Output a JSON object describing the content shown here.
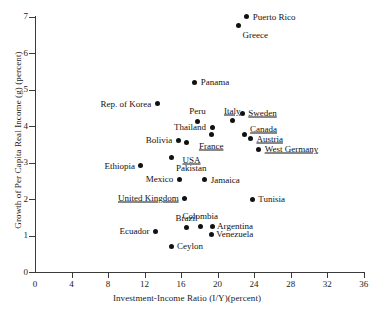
{
  "chart_data": {
    "type": "scatter",
    "title": "",
    "xlabel": "Investment-Income Ratio (I/Y)(percent)",
    "ylabel": "Growth of Per Capita Real Income (g) (percent)",
    "xlim": [
      0,
      36
    ],
    "ylim": [
      0,
      7
    ],
    "xticks": [
      "0",
      "4",
      "8",
      "12",
      "16",
      "20",
      "24",
      "28",
      "32",
      "36"
    ],
    "yticks": [
      "0",
      "1",
      "2",
      "3",
      "4",
      "5",
      "6",
      "7"
    ],
    "grid": false,
    "legend": null,
    "points": [
      {
        "label": "Puerto Rico",
        "x": 23.2,
        "y": 7.0,
        "underlined": false,
        "pos": "l",
        "dx": 6,
        "dy": 0
      },
      {
        "label": "Greece",
        "x": 22.3,
        "y": 6.75,
        "underlined": false,
        "pos": "l",
        "dx": 4,
        "dy": 9
      },
      {
        "label": "Panama",
        "x": 17.5,
        "y": 5.2,
        "underlined": false,
        "pos": "l",
        "dx": 6,
        "dy": 0
      },
      {
        "label": "Rep. of Korea",
        "x": 13.4,
        "y": 4.62,
        "underlined": false,
        "pos": "r",
        "dx": -6,
        "dy": 0
      },
      {
        "label": "Sweden",
        "x": 22.7,
        "y": 4.36,
        "underlined": true,
        "pos": "l",
        "dx": 6,
        "dy": 0
      },
      {
        "label": "Italy",
        "x": 21.6,
        "y": 4.15,
        "underlined": true,
        "pos": "c",
        "dx": 0,
        "dy": -10
      },
      {
        "label": "Peru",
        "x": 17.8,
        "y": 4.14,
        "underlined": false,
        "pos": "c",
        "dx": 0,
        "dy": -10
      },
      {
        "label": "Thailand",
        "x": 19.4,
        "y": 3.97,
        "underlined": false,
        "pos": "r",
        "dx": -6,
        "dy": 0
      },
      {
        "label": "Canada",
        "x": 22.9,
        "y": 3.77,
        "underlined": true,
        "pos": "l",
        "dx": 6,
        "dy": -6
      },
      {
        "label": "France",
        "x": 19.3,
        "y": 3.78,
        "underlined": true,
        "pos": "c",
        "dx": 0,
        "dy": 12
      },
      {
        "label": "Austria",
        "x": 23.6,
        "y": 3.66,
        "underlined": true,
        "pos": "l",
        "dx": 6,
        "dy": 0
      },
      {
        "label": "Bolivia",
        "x": 15.7,
        "y": 3.62,
        "underlined": false,
        "pos": "r",
        "dx": -6,
        "dy": 0
      },
      {
        "label": "West Germany",
        "x": 24.5,
        "y": 3.37,
        "underlined": true,
        "pos": "l",
        "dx": 6,
        "dy": 0
      },
      {
        "label": "USA",
        "x": 16.6,
        "y": 3.54,
        "underlined": true,
        "pos": "c",
        "dx": 5,
        "dy": 17
      },
      {
        "label": "Pakistan",
        "x": 15.0,
        "y": 3.14,
        "underlined": false,
        "pos": "l",
        "dx": 4,
        "dy": 10
      },
      {
        "label": "Ethiopia",
        "x": 11.6,
        "y": 2.92,
        "underlined": false,
        "pos": "r",
        "dx": -6,
        "dy": 0
      },
      {
        "label": "Mexico",
        "x": 15.8,
        "y": 2.55,
        "underlined": false,
        "pos": "r",
        "dx": -6,
        "dy": 0
      },
      {
        "label": "Jamaica",
        "x": 18.6,
        "y": 2.53,
        "underlined": false,
        "pos": "l",
        "dx": 6,
        "dy": 0
      },
      {
        "label": "United Kingdom",
        "x": 16.4,
        "y": 2.03,
        "underlined": true,
        "pos": "r",
        "dx": -6,
        "dy": 0
      },
      {
        "label": "Tunisia",
        "x": 23.8,
        "y": 2.0,
        "underlined": false,
        "pos": "l",
        "dx": 6,
        "dy": 0
      },
      {
        "label": "Argentina",
        "x": 19.4,
        "y": 1.25,
        "underlined": false,
        "pos": "l",
        "dx": 5,
        "dy": 0
      },
      {
        "label": "Colombia",
        "x": 18.1,
        "y": 1.25,
        "underlined": false,
        "pos": "c",
        "dx": 0,
        "dy": -10
      },
      {
        "label": "Brazil",
        "x": 16.6,
        "y": 1.22,
        "underlined": false,
        "pos": "c",
        "dx": 0,
        "dy": -10
      },
      {
        "label": "Venezuela",
        "x": 19.3,
        "y": 1.04,
        "underlined": false,
        "pos": "l",
        "dx": 5,
        "dy": 0
      },
      {
        "label": "Ecuador",
        "x": 13.2,
        "y": 1.12,
        "underlined": false,
        "pos": "r",
        "dx": -6,
        "dy": 0
      },
      {
        "label": "Ceylon",
        "x": 15.0,
        "y": 0.7,
        "underlined": false,
        "pos": "l",
        "dx": 5,
        "dy": 0
      }
    ]
  },
  "geometry": {
    "origin_x": 35,
    "origin_y": 272,
    "px_per_x": 9.13,
    "px_per_y": 36.45
  }
}
